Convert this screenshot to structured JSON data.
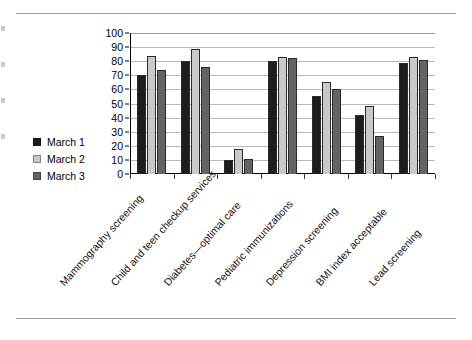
{
  "chart_data": {
    "type": "bar",
    "title": "",
    "subtitle": "",
    "xlabel": "",
    "ylabel": "",
    "ylim": [
      0,
      100
    ],
    "yticks": [
      0,
      10,
      20,
      30,
      40,
      50,
      60,
      70,
      80,
      90,
      100
    ],
    "ytick_labels": [
      "0",
      "10",
      "20",
      "30",
      "40",
      "50",
      "60",
      "70",
      "80",
      "90",
      "100"
    ],
    "grid": "horizontal",
    "legend_position": "left",
    "categories": [
      "Mammography screening",
      "Child and teen checkup services",
      "Diabetes—optimal care",
      "Pediatric immunizations",
      "Depression screening",
      "BMI index acceptable",
      "Lead screening"
    ],
    "series": [
      {
        "name": "March 1",
        "color": "#1d1d1d",
        "values": [
          70,
          80,
          10,
          80,
          55,
          42,
          79
        ]
      },
      {
        "name": "March 2",
        "color": "#c9c9c9",
        "values": [
          84,
          89,
          18,
          83,
          65,
          48,
          83
        ]
      },
      {
        "name": "March 3",
        "color": "#636363",
        "values": [
          74,
          76,
          11,
          82,
          60,
          27,
          81
        ]
      }
    ]
  },
  "legend": {
    "items": [
      {
        "label": "March 1",
        "color": "#1d1d1d"
      },
      {
        "label": "March 2",
        "color": "#c9c9c9"
      },
      {
        "label": "March 3",
        "color": "#636363"
      }
    ]
  },
  "colors": {
    "series_1": "#1d1d1d",
    "series_2": "#c9c9c9",
    "series_3": "#636363",
    "gridline": "#b9b9b9",
    "axis": "#000000",
    "page_rule": "#9a9a9a",
    "background": "#ffffff"
  }
}
